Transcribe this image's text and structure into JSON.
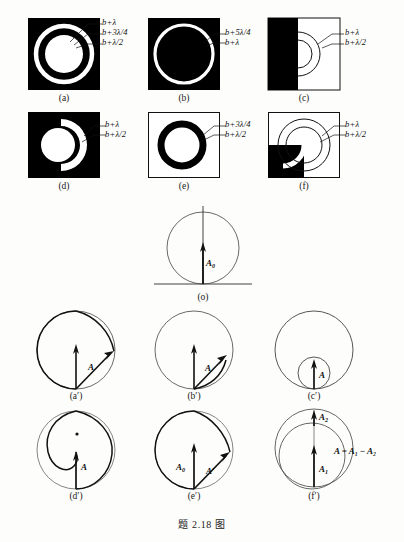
{
  "caption": "题 2.18 图",
  "colors": {
    "black": "#000000",
    "white": "#ffffff",
    "ink": "#111111",
    "page": "#fdfdfb"
  },
  "figure": {
    "title": "题 2.18 图",
    "zone_plate_panels": [
      {
        "id": "a",
        "label": "(a)",
        "square_fill": "black",
        "description": "black square with white annular ring and white central disk",
        "annotations": [
          "b+λ",
          "b+3λ/4",
          "b+λ/2"
        ]
      },
      {
        "id": "b",
        "label": "(b)",
        "square_fill": "black",
        "description": "black square with a single thin white circular ring",
        "annotations": [
          "b+5λ/4",
          "b+λ"
        ]
      },
      {
        "id": "c",
        "label": "(c)",
        "square_fill": "half-black-left",
        "description": "square with left half black, right half white containing two semicircular arcs",
        "annotations": [
          "b+λ",
          "b+λ/2"
        ]
      },
      {
        "id": "d",
        "label": "(d)",
        "square_fill": "black",
        "description": "black square with white central disk and white crescent on right side",
        "annotations": [
          "b+λ",
          "b+λ/2"
        ]
      },
      {
        "id": "e",
        "label": "(e)",
        "square_fill": "white",
        "description": "white square with thick black annular ring",
        "annotations": [
          "b+3λ/4",
          "b+λ/2"
        ]
      },
      {
        "id": "f",
        "label": "(f)",
        "square_fill": "white-with-black-quadrant",
        "description": "white square with black lower-left quadrant, two concentric circle outlines and white arc band",
        "annotations": [
          "b+λ",
          "b+λ/2"
        ]
      }
    ],
    "vector_panels": [
      {
        "id": "o",
        "label": "(o)",
        "description": "reference circle tangent to horizontal baseline with vertical amplitude vector",
        "vectors": [
          {
            "name": "A₀",
            "label_sub": "0",
            "label_main": "A"
          }
        ],
        "has_baseline": true
      },
      {
        "id": "a'",
        "label": "(a′)",
        "description": "circle with inward spiral from top to right edge, vertical reference vector and resultant vector",
        "vectors": [
          {
            "name": "A",
            "label_main": "A",
            "label_sub": ""
          }
        ]
      },
      {
        "id": "b'",
        "label": "(b′)",
        "description": "circle with short arc at lower right, vertical reference vector and resultant vector",
        "vectors": [
          {
            "name": "A",
            "label_main": "A",
            "label_sub": ""
          }
        ]
      },
      {
        "id": "c'",
        "label": "(c′)",
        "description": "large circle with small internally tangent circle, short vertical vector",
        "vectors": [
          {
            "name": "A",
            "label_main": "A",
            "label_sub": ""
          }
        ]
      },
      {
        "id": "d'",
        "label": "(d′)",
        "description": "circle with S-shaped double spiral, centre dot and vertical vector",
        "vectors": [
          {
            "name": "A",
            "label_main": "A",
            "label_sub": ""
          }
        ]
      },
      {
        "id": "e'",
        "label": "(e′)",
        "description": "circle with spiral arc, vertical vector A0 and resultant vector A'",
        "vectors": [
          {
            "name": "A₀",
            "label_main": "A",
            "label_sub": "0"
          },
          {
            "name": "A′",
            "label_main": "A′",
            "label_sub": ""
          }
        ]
      },
      {
        "id": "f'",
        "label": "(f′)",
        "description": "two overlapping circles with vectors A1 and A2",
        "vectors": [
          {
            "name": "A₁",
            "label_main": "A",
            "label_sub": "1"
          },
          {
            "name": "A₂",
            "label_main": "A",
            "label_sub": "2"
          }
        ],
        "equation": "A = A₁ − A₂"
      }
    ],
    "annotation_texts": {
      "b_lambda": "b+λ",
      "b_3lambda_4": "b+3λ/4",
      "b_lambda_2": "b+λ/2",
      "b_5lambda_4": "b+5λ/4"
    },
    "equation_f": "A = A₁ − A₂"
  }
}
